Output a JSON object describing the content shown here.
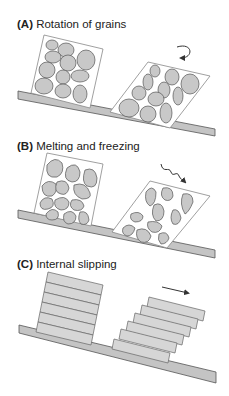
{
  "panels": [
    {
      "id": "A",
      "tag": "(A)",
      "title": "Rotation of grains",
      "arrow": "curved-rotation-arrow"
    },
    {
      "id": "B",
      "tag": "(B)",
      "title": "Melting and freezing",
      "arrow": "wavy-arrow"
    },
    {
      "id": "C",
      "tag": "(C)",
      "title": "Internal slipping",
      "arrow": "straight-arrow"
    }
  ],
  "colors": {
    "grain": "#c8c8c8",
    "slab": "#c4c4c4",
    "outline": "#555555",
    "box": "#888888",
    "layer": "#d6d6d6"
  }
}
